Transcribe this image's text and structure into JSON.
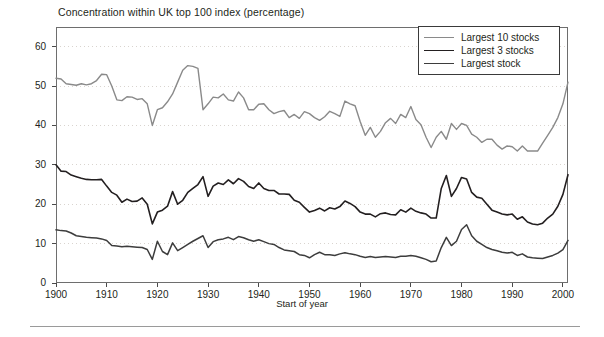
{
  "chart_data": {
    "type": "line",
    "title": "Concentration within UK top 100 index (percentage)",
    "subtitle": "",
    "xlabel": "Start of year",
    "ylabel": "",
    "xlim": [
      1900,
      2001
    ],
    "ylim": [
      0,
      65
    ],
    "grid": "horizontal-dotted",
    "legend_position": "top-right",
    "x_ticks": [
      "1900",
      "1910",
      "1920",
      "1930",
      "1940",
      "1950",
      "1960",
      "1970",
      "1980",
      "1990",
      "2000"
    ],
    "x_tick_values": [
      1900,
      1910,
      1920,
      1930,
      1940,
      1950,
      1960,
      1970,
      1980,
      1990,
      2000
    ],
    "y_ticks": [
      "0",
      "10",
      "20",
      "30",
      "40",
      "50",
      "60"
    ],
    "y_tick_values": [
      0,
      10,
      20,
      30,
      40,
      50,
      60
    ],
    "x": [
      1900,
      1901,
      1902,
      1903,
      1904,
      1905,
      1906,
      1907,
      1908,
      1909,
      1910,
      1911,
      1912,
      1913,
      1914,
      1915,
      1916,
      1917,
      1918,
      1919,
      1920,
      1921,
      1922,
      1923,
      1924,
      1925,
      1926,
      1927,
      1928,
      1929,
      1930,
      1931,
      1932,
      1933,
      1934,
      1935,
      1936,
      1937,
      1938,
      1939,
      1940,
      1941,
      1942,
      1943,
      1944,
      1945,
      1946,
      1947,
      1948,
      1949,
      1950,
      1951,
      1952,
      1953,
      1954,
      1955,
      1956,
      1957,
      1958,
      1959,
      1960,
      1961,
      1962,
      1963,
      1964,
      1965,
      1966,
      1967,
      1968,
      1969,
      1970,
      1971,
      1972,
      1973,
      1974,
      1975,
      1976,
      1977,
      1978,
      1979,
      1980,
      1981,
      1982,
      1983,
      1984,
      1985,
      1986,
      1987,
      1988,
      1989,
      1990,
      1991,
      1992,
      1993,
      1994,
      1995,
      1996,
      1997,
      1998,
      1999,
      2000,
      2001
    ],
    "series": [
      {
        "name": "Largest 10 stocks",
        "color": "#8a8a8a",
        "width": 1.4,
        "values": [
          52.0,
          51.8,
          50.6,
          50.4,
          50.2,
          50.6,
          50.3,
          50.6,
          51.4,
          53.0,
          52.9,
          50.0,
          46.5,
          46.3,
          47.3,
          47.2,
          46.6,
          46.8,
          45.5,
          40.0,
          44.0,
          44.5,
          46.0,
          48.0,
          51.0,
          54.0,
          55.2,
          55.0,
          54.5,
          44.0,
          45.5,
          47.2,
          47.0,
          48.0,
          46.5,
          46.2,
          48.5,
          47.0,
          44.0,
          44.0,
          45.4,
          45.5,
          44.0,
          43.0,
          43.5,
          43.8,
          42.0,
          42.8,
          41.8,
          43.5,
          43.0,
          42.0,
          41.3,
          42.2,
          43.6,
          43.0,
          42.3,
          46.2,
          45.5,
          45.0,
          41.0,
          37.5,
          39.5,
          37.0,
          38.5,
          40.7,
          41.8,
          40.5,
          42.8,
          42.0,
          44.8,
          41.5,
          40.2,
          37.0,
          34.4,
          37.0,
          38.5,
          36.5,
          40.5,
          39.0,
          40.5,
          40.0,
          37.8,
          37.0,
          35.7,
          36.5,
          36.5,
          35.0,
          34.0,
          34.8,
          34.6,
          33.5,
          34.8,
          33.5,
          33.5,
          33.5,
          35.5,
          37.5,
          39.5,
          42.0,
          45.5,
          51.0
        ]
      },
      {
        "name": "Largest 3 stocks",
        "color": "#231f20",
        "width": 1.6,
        "values": [
          30.0,
          28.4,
          28.3,
          27.4,
          27.0,
          26.6,
          26.3,
          26.2,
          26.2,
          26.3,
          24.6,
          23.0,
          22.3,
          20.5,
          21.3,
          20.7,
          20.8,
          21.6,
          20.0,
          15.0,
          18.0,
          18.5,
          19.5,
          23.2,
          20.0,
          21.0,
          23.0,
          24.0,
          25.0,
          27.0,
          22.0,
          24.6,
          25.4,
          25.0,
          26.2,
          25.2,
          26.5,
          25.8,
          24.5,
          24.0,
          25.4,
          24.0,
          23.5,
          23.5,
          22.6,
          22.6,
          22.5,
          21.0,
          20.5,
          19.2,
          18.0,
          18.4,
          19.0,
          18.3,
          19.1,
          18.8,
          19.4,
          20.8,
          20.2,
          19.4,
          18.0,
          17.5,
          17.5,
          16.8,
          17.6,
          17.8,
          17.4,
          17.3,
          18.6,
          18.0,
          19.0,
          18.2,
          17.8,
          17.5,
          16.5,
          16.5,
          24.0,
          27.3,
          22.0,
          24.0,
          26.8,
          26.4,
          23.0,
          21.8,
          21.5,
          20.0,
          18.5,
          18.0,
          17.5,
          17.3,
          17.5,
          16.2,
          16.8,
          15.5,
          15.0,
          14.8,
          15.2,
          16.5,
          17.5,
          19.5,
          22.5,
          27.5
        ]
      },
      {
        "name": "Largest stock",
        "color": "#3d3d3d",
        "width": 1.5,
        "values": [
          13.5,
          13.3,
          13.2,
          12.7,
          12.0,
          11.8,
          11.6,
          11.5,
          11.4,
          11.2,
          10.8,
          9.5,
          9.4,
          9.2,
          9.3,
          9.2,
          9.1,
          9.0,
          8.5,
          6.0,
          10.6,
          8.0,
          7.2,
          10.2,
          8.2,
          9.0,
          9.8,
          10.6,
          11.3,
          12.0,
          9.0,
          10.5,
          11.0,
          11.2,
          11.6,
          11.0,
          11.8,
          11.5,
          11.0,
          10.6,
          11.0,
          10.5,
          10.0,
          9.8,
          9.0,
          8.4,
          8.2,
          8.0,
          7.2,
          7.0,
          6.4,
          7.2,
          7.8,
          7.2,
          7.2,
          7.0,
          7.4,
          7.7,
          7.4,
          7.2,
          6.8,
          6.5,
          6.7,
          6.5,
          6.6,
          6.7,
          6.6,
          6.5,
          6.8,
          6.8,
          7.0,
          6.8,
          6.4,
          6.0,
          5.4,
          5.6,
          9.0,
          11.6,
          9.5,
          10.6,
          13.6,
          14.8,
          12.0,
          10.6,
          9.8,
          9.0,
          8.5,
          8.2,
          7.8,
          7.6,
          7.8,
          7.0,
          7.4,
          6.6,
          6.4,
          6.3,
          6.2,
          6.6,
          7.0,
          7.6,
          8.5,
          10.8
        ]
      }
    ]
  },
  "legend": {
    "items": [
      {
        "label": "Largest 10 stocks"
      },
      {
        "label": "Largest 3 stocks"
      },
      {
        "label": "Largest stock"
      }
    ]
  }
}
